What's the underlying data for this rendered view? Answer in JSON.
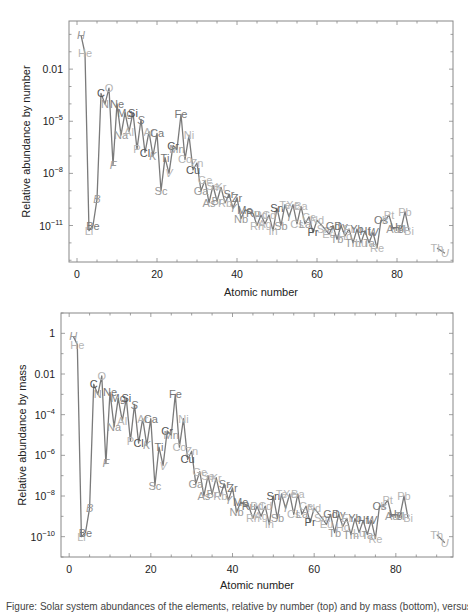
{
  "chart_data": [
    {
      "type": "line",
      "id": "by-number",
      "title": "",
      "xlabel": "Atomic number",
      "ylabel": "Relative abundance by number",
      "xlim": [
        -2,
        94
      ],
      "ylim_log10": [
        -13.1,
        0.77
      ],
      "xticks": [
        0,
        20,
        40,
        60,
        80
      ],
      "xtick_labels": [
        "0",
        "20",
        "40",
        "60",
        "80"
      ],
      "yticks_log10": [
        -2,
        -5,
        -8,
        -11
      ],
      "ytick_labels": [
        "0.01",
        "10^-5",
        "10^-8",
        "10^-11"
      ],
      "grid": false,
      "legend": "none",
      "series_note": "log10 of relative abundance per element; labels are element symbols",
      "points": [
        {
          "z": 1,
          "el": "H",
          "log": -0.04
        },
        {
          "z": 2,
          "el": "He",
          "log": -1.1
        },
        {
          "z": 3,
          "el": "Li",
          "log": -11.3
        },
        {
          "z": 4,
          "el": "Be",
          "log": -11.0
        },
        {
          "z": 5,
          "el": "B",
          "log": -9.5
        },
        {
          "z": 6,
          "el": "C",
          "log": -3.4
        },
        {
          "z": 7,
          "el": "N",
          "log": -4.0
        },
        {
          "z": 8,
          "el": "O",
          "log": -3.1
        },
        {
          "z": 9,
          "el": "F",
          "log": -7.5
        },
        {
          "z": 10,
          "el": "Ne",
          "log": -4.0
        },
        {
          "z": 11,
          "el": "Na",
          "log": -5.8
        },
        {
          "z": 12,
          "el": "Mg",
          "log": -4.5
        },
        {
          "z": 13,
          "el": "Al",
          "log": -5.6
        },
        {
          "z": 14,
          "el": "Si",
          "log": -4.5
        },
        {
          "z": 15,
          "el": "P",
          "log": -6.6
        },
        {
          "z": 16,
          "el": "S",
          "log": -4.9
        },
        {
          "z": 17,
          "el": "Cl",
          "log": -6.8
        },
        {
          "z": 18,
          "el": "Ar",
          "log": -5.6
        },
        {
          "z": 19,
          "el": "K",
          "log": -7.0
        },
        {
          "z": 20,
          "el": "Ca",
          "log": -5.7
        },
        {
          "z": 21,
          "el": "Sc",
          "log": -9.0
        },
        {
          "z": 22,
          "el": "Ti",
          "log": -7.1
        },
        {
          "z": 23,
          "el": "V",
          "log": -8.0
        },
        {
          "z": 24,
          "el": "Cr",
          "log": -6.4
        },
        {
          "z": 25,
          "el": "Mn",
          "log": -6.6
        },
        {
          "z": 26,
          "el": "Fe",
          "log": -4.6
        },
        {
          "z": 27,
          "el": "Co",
          "log": -7.2
        },
        {
          "z": 28,
          "el": "Ni",
          "log": -5.8
        },
        {
          "z": 29,
          "el": "Cu",
          "log": -7.8
        },
        {
          "z": 30,
          "el": "Zn",
          "log": -7.4
        },
        {
          "z": 31,
          "el": "Ga",
          "log": -9.0
        },
        {
          "z": 32,
          "el": "Ge",
          "log": -8.4
        },
        {
          "z": 33,
          "el": "As",
          "log": -9.7
        },
        {
          "z": 34,
          "el": "Se",
          "log": -8.7
        },
        {
          "z": 35,
          "el": "Br",
          "log": -9.6
        },
        {
          "z": 36,
          "el": "Kr",
          "log": -8.8
        },
        {
          "z": 37,
          "el": "Rb",
          "log": -9.7
        },
        {
          "z": 38,
          "el": "Sr",
          "log": -9.2
        },
        {
          "z": 39,
          "el": "Y",
          "log": -10.0
        },
        {
          "z": 40,
          "el": "Zr",
          "log": -9.4
        },
        {
          "z": 41,
          "el": "Nb",
          "log": -10.6
        },
        {
          "z": 42,
          "el": "Mo",
          "log": -10.1
        },
        {
          "z": 44,
          "el": "Ru",
          "log": -10.3
        },
        {
          "z": 45,
          "el": "Rh",
          "log": -11.0
        },
        {
          "z": 46,
          "el": "Pd",
          "log": -10.4
        },
        {
          "z": 47,
          "el": "Ag",
          "log": -10.9
        },
        {
          "z": 48,
          "el": "Cd",
          "log": -10.4
        },
        {
          "z": 49,
          "el": "In",
          "log": -11.3
        },
        {
          "z": 50,
          "el": "Sn",
          "log": -10.0
        },
        {
          "z": 51,
          "el": "Sb",
          "log": -11.0
        },
        {
          "z": 52,
          "el": "Te",
          "log": -9.8
        },
        {
          "z": 53,
          "el": "I",
          "log": -10.5
        },
        {
          "z": 54,
          "el": "Xe",
          "log": -9.8
        },
        {
          "z": 55,
          "el": "Cs",
          "log": -10.9
        },
        {
          "z": 56,
          "el": "Ba",
          "log": -9.9
        },
        {
          "z": 57,
          "el": "La",
          "log": -10.9
        },
        {
          "z": 58,
          "el": "Ce",
          "log": -10.5
        },
        {
          "z": 59,
          "el": "Pr",
          "log": -11.4
        },
        {
          "z": 60,
          "el": "Nd",
          "log": -10.7
        },
        {
          "z": 62,
          "el": "Sm",
          "log": -11.2
        },
        {
          "z": 63,
          "el": "Eu",
          "log": -11.5
        },
        {
          "z": 64,
          "el": "Gd",
          "log": -11.0
        },
        {
          "z": 65,
          "el": "Tb",
          "log": -11.8
        },
        {
          "z": 66,
          "el": "Dy",
          "log": -11.0
        },
        {
          "z": 67,
          "el": "Ho",
          "log": -11.6
        },
        {
          "z": 68,
          "el": "Er",
          "log": -11.2
        },
        {
          "z": 69,
          "el": "Tm",
          "log": -12.0
        },
        {
          "z": 70,
          "el": "Yb",
          "log": -11.2
        },
        {
          "z": 71,
          "el": "Lu",
          "log": -12.0
        },
        {
          "z": 72,
          "el": "Hf",
          "log": -11.3
        },
        {
          "z": 73,
          "el": "Ta",
          "log": -12.0
        },
        {
          "z": 74,
          "el": "W",
          "log": -11.4
        },
        {
          "z": 75,
          "el": "Re",
          "log": -12.3
        },
        {
          "z": 76,
          "el": "Os",
          "log": -10.7
        },
        {
          "z": 77,
          "el": "Ir",
          "log": -10.7
        },
        {
          "z": 78,
          "el": "Pt",
          "log": -10.4
        },
        {
          "z": 79,
          "el": "Au",
          "log": -11.2
        },
        {
          "z": 80,
          "el": "Hg",
          "log": -11.1
        },
        {
          "z": 81,
          "el": "Tl",
          "log": -11.2
        },
        {
          "z": 82,
          "el": "Pb",
          "log": -10.2
        },
        {
          "z": 83,
          "el": "Bi",
          "log": -11.3
        },
        {
          "z": 90,
          "el": "Th",
          "log": -12.3
        },
        {
          "z": 92,
          "el": "U",
          "log": -12.6
        }
      ]
    },
    {
      "type": "line",
      "id": "by-mass",
      "title": "",
      "xlabel": "Atomic number",
      "ylabel": "Relative abundance by mass",
      "xlim": [
        -2,
        94
      ],
      "ylim_log10": [
        -11.0,
        1.0
      ],
      "xticks": [
        0,
        20,
        40,
        60,
        80
      ],
      "xtick_labels": [
        "0",
        "20",
        "40",
        "60",
        "80"
      ],
      "yticks_log10": [
        0,
        -2,
        -4,
        -6,
        -8,
        -10
      ],
      "ytick_labels": [
        "1",
        "0.01",
        "10^-4",
        "10^-6",
        "10^-8",
        "10^-10"
      ],
      "grid": false,
      "legend": "none",
      "series_note": "log10 of relative mass abundance per element; labels are element symbols",
      "points": [
        {
          "z": 1,
          "el": "H",
          "log": -0.15
        },
        {
          "z": 2,
          "el": "He",
          "log": -0.55
        },
        {
          "z": 3,
          "el": "Li",
          "log": -10.0
        },
        {
          "z": 4,
          "el": "Be",
          "log": -9.8
        },
        {
          "z": 5,
          "el": "B",
          "log": -8.6
        },
        {
          "z": 6,
          "el": "C",
          "log": -2.5
        },
        {
          "z": 7,
          "el": "N",
          "log": -3.0
        },
        {
          "z": 8,
          "el": "O",
          "log": -2.1
        },
        {
          "z": 9,
          "el": "F",
          "log": -6.4
        },
        {
          "z": 10,
          "el": "Ne",
          "log": -2.9
        },
        {
          "z": 11,
          "el": "Na",
          "log": -4.6
        },
        {
          "z": 12,
          "el": "Mg",
          "log": -3.2
        },
        {
          "z": 13,
          "el": "Al",
          "log": -4.3
        },
        {
          "z": 14,
          "el": "Si",
          "log": -3.2
        },
        {
          "z": 15,
          "el": "P",
          "log": -5.3
        },
        {
          "z": 16,
          "el": "S",
          "log": -3.5
        },
        {
          "z": 17,
          "el": "Cl",
          "log": -5.4
        },
        {
          "z": 18,
          "el": "Ar",
          "log": -4.2
        },
        {
          "z": 19,
          "el": "K",
          "log": -5.5
        },
        {
          "z": 20,
          "el": "Ca",
          "log": -4.2
        },
        {
          "z": 21,
          "el": "Sc",
          "log": -7.5
        },
        {
          "z": 22,
          "el": "Ti",
          "log": -5.6
        },
        {
          "z": 23,
          "el": "V",
          "log": -6.5
        },
        {
          "z": 24,
          "el": "Cr",
          "log": -4.8
        },
        {
          "z": 25,
          "el": "Mn",
          "log": -5.0
        },
        {
          "z": 26,
          "el": "Fe",
          "log": -3.0
        },
        {
          "z": 27,
          "el": "Co",
          "log": -5.6
        },
        {
          "z": 28,
          "el": "Ni",
          "log": -4.2
        },
        {
          "z": 29,
          "el": "Cu",
          "log": -6.2
        },
        {
          "z": 30,
          "el": "Zn",
          "log": -5.8
        },
        {
          "z": 31,
          "el": "Ga",
          "log": -7.4
        },
        {
          "z": 32,
          "el": "Ge",
          "log": -6.8
        },
        {
          "z": 33,
          "el": "As",
          "log": -8.0
        },
        {
          "z": 34,
          "el": "Se",
          "log": -7.0
        },
        {
          "z": 35,
          "el": "Br",
          "log": -7.9
        },
        {
          "z": 36,
          "el": "Kr",
          "log": -7.1
        },
        {
          "z": 37,
          "el": "Rb",
          "log": -8.0
        },
        {
          "z": 38,
          "el": "Sr",
          "log": -7.4
        },
        {
          "z": 39,
          "el": "Y",
          "log": -8.2
        },
        {
          "z": 40,
          "el": "Zr",
          "log": -7.6
        },
        {
          "z": 41,
          "el": "Nb",
          "log": -8.8
        },
        {
          "z": 42,
          "el": "Mo",
          "log": -8.3
        },
        {
          "z": 44,
          "el": "Ru",
          "log": -8.5
        },
        {
          "z": 45,
          "el": "Rh",
          "log": -9.1
        },
        {
          "z": 46,
          "el": "Pd",
          "log": -8.5
        },
        {
          "z": 47,
          "el": "Ag",
          "log": -9.0
        },
        {
          "z": 48,
          "el": "Cd",
          "log": -8.5
        },
        {
          "z": 49,
          "el": "In",
          "log": -9.4
        },
        {
          "z": 50,
          "el": "Sn",
          "log": -8.0
        },
        {
          "z": 51,
          "el": "Sb",
          "log": -9.1
        },
        {
          "z": 52,
          "el": "Te",
          "log": -7.9
        },
        {
          "z": 53,
          "el": "I",
          "log": -8.6
        },
        {
          "z": 54,
          "el": "Xe",
          "log": -7.9
        },
        {
          "z": 55,
          "el": "Cs",
          "log": -8.9
        },
        {
          "z": 56,
          "el": "Ba",
          "log": -7.9
        },
        {
          "z": 57,
          "el": "La",
          "log": -8.9
        },
        {
          "z": 58,
          "el": "Ce",
          "log": -8.5
        },
        {
          "z": 59,
          "el": "Pr",
          "log": -9.3
        },
        {
          "z": 60,
          "el": "Nd",
          "log": -8.6
        },
        {
          "z": 62,
          "el": "Sm",
          "log": -9.1
        },
        {
          "z": 63,
          "el": "Eu",
          "log": -9.4
        },
        {
          "z": 64,
          "el": "Gd",
          "log": -8.9
        },
        {
          "z": 65,
          "el": "Tb",
          "log": -9.8
        },
        {
          "z": 66,
          "el": "Dy",
          "log": -8.9
        },
        {
          "z": 67,
          "el": "Ho",
          "log": -9.5
        },
        {
          "z": 68,
          "el": "Er",
          "log": -9.1
        },
        {
          "z": 69,
          "el": "Tm",
          "log": -9.9
        },
        {
          "z": 70,
          "el": "Yb",
          "log": -9.1
        },
        {
          "z": 71,
          "el": "Lu",
          "log": -9.8
        },
        {
          "z": 72,
          "el": "Hf",
          "log": -9.2
        },
        {
          "z": 73,
          "el": "Ta",
          "log": -9.9
        },
        {
          "z": 74,
          "el": "W",
          "log": -9.2
        },
        {
          "z": 75,
          "el": "Re",
          "log": -10.1
        },
        {
          "z": 76,
          "el": "Os",
          "log": -8.5
        },
        {
          "z": 77,
          "el": "Ir",
          "log": -8.5
        },
        {
          "z": 78,
          "el": "Pt",
          "log": -8.2
        },
        {
          "z": 79,
          "el": "Au",
          "log": -9.0
        },
        {
          "z": 80,
          "el": "Hg",
          "log": -8.9
        },
        {
          "z": 81,
          "el": "Tl",
          "log": -9.0
        },
        {
          "z": 82,
          "el": "Pb",
          "log": -8.0
        },
        {
          "z": 83,
          "el": "Bi",
          "log": -9.1
        },
        {
          "z": 90,
          "el": "Th",
          "log": -9.9
        },
        {
          "z": 92,
          "el": "U",
          "log": -10.3
        }
      ]
    }
  ],
  "style": {
    "line_color": "#7a7a7a",
    "axis_color": "#888888",
    "text_color": "#222222",
    "label_shades": [
      "#555555",
      "#777777",
      "#999999",
      "#b5b5b5"
    ],
    "bold_dark_labels": [
      "Si",
      "Cl",
      "Cu",
      "Cr",
      "Sn",
      "Pr",
      "C"
    ],
    "light_labels": [
      "He",
      "O",
      "Ni",
      "Zn",
      "Ge",
      "Rb",
      "Nd",
      "Re",
      "Th",
      "U",
      "Pt",
      "Ir",
      "Eu",
      "Ag",
      "Pd",
      "Ba",
      "Se",
      "Kr",
      "Ar",
      "Al",
      "P",
      "Cl",
      "V",
      "Li",
      "Co",
      "Sm",
      "Er",
      "Ho",
      "Lu",
      "Bi",
      "Pb",
      "Te",
      "Xe",
      "Cs",
      "Ce",
      "Rh",
      "Cd",
      "In"
    ],
    "italic_labels": [
      "H",
      "B",
      "F",
      "S",
      "U",
      "K",
      "W",
      "V",
      "I",
      "Y"
    ]
  },
  "panels": [
    {
      "frame": {
        "left": 69,
        "top": 21,
        "right": 453,
        "bottom": 262
      },
      "ylabel_x": 30,
      "xlabel_y": 296
    },
    {
      "frame": {
        "left": 61,
        "top": 313,
        "right": 453,
        "bottom": 557
      },
      "ylabel_x": 26,
      "xlabel_y": 589
    }
  ],
  "caption": "Figure: Solar system abundances of the elements, relative by number (top) and by mass (bottom), versus atomic number."
}
